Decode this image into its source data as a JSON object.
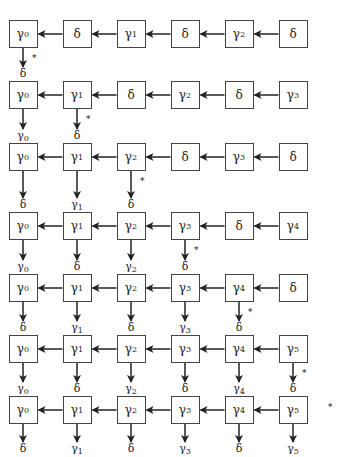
{
  "diagram": {
    "columns_x": [
      23,
      77,
      131,
      185,
      239,
      293
    ],
    "rows_y": [
      20,
      81,
      143,
      212,
      274,
      335,
      396
    ],
    "rows": [
      {
        "cells": [
          "γ0",
          "δ",
          "γ1",
          "δ",
          "γ2",
          "δ"
        ],
        "down_from_cols": [
          0
        ],
        "star_cols": [
          0
        ],
        "labels_below": [
          "δ"
        ]
      },
      {
        "cells": [
          "γ0",
          "γ1",
          "δ",
          "γ2",
          "δ",
          "γ3"
        ],
        "down_from_cols": [
          0,
          1
        ],
        "star_cols": [
          1
        ],
        "labels_below": [
          "γ0",
          "δ"
        ]
      },
      {
        "cells": [
          "γ0",
          "γ1",
          "γ2",
          "δ",
          "γ3",
          "δ"
        ],
        "down_from_cols": [
          0,
          1,
          2
        ],
        "star_cols": [
          2
        ],
        "labels_below": [
          "δ",
          "γ1",
          "δ"
        ]
      },
      {
        "cells": [
          "γ0",
          "γ1",
          "γ2",
          "γ3",
          "δ",
          "γ4"
        ],
        "down_from_cols": [
          0,
          1,
          2,
          3
        ],
        "star_cols": [
          3
        ],
        "labels_below": [
          "γ0",
          "δ",
          "γ2",
          "δ"
        ]
      },
      {
        "cells": [
          "γ0",
          "γ1",
          "γ2",
          "γ3",
          "γ4",
          "δ"
        ],
        "down_from_cols": [
          0,
          1,
          2,
          3,
          4
        ],
        "star_cols": [
          4
        ],
        "labels_below": [
          "δ",
          "γ1",
          "δ",
          "γ3",
          "δ"
        ]
      },
      {
        "cells": [
          "γ0",
          "γ1",
          "γ2",
          "γ3",
          "γ4",
          "γ5"
        ],
        "down_from_cols": [
          0,
          1,
          2,
          3,
          4,
          5
        ],
        "star_cols": [
          5
        ],
        "labels_below": [
          "γ0",
          "δ",
          "γ2",
          "δ",
          "γ4",
          "δ"
        ]
      },
      {
        "cells": [
          "γ0",
          "γ1",
          "γ2",
          "γ3",
          "γ4",
          "γ5"
        ],
        "down_from_cols": [
          0,
          1,
          2,
          3,
          4,
          5
        ],
        "star_cols": [],
        "labels_below": [
          "δ",
          "γ1",
          "δ",
          "γ3",
          "δ",
          "γ5"
        ]
      }
    ],
    "extra_star": {
      "x": 328,
      "y": 403,
      "text": "*"
    },
    "star_symbol": "*"
  }
}
